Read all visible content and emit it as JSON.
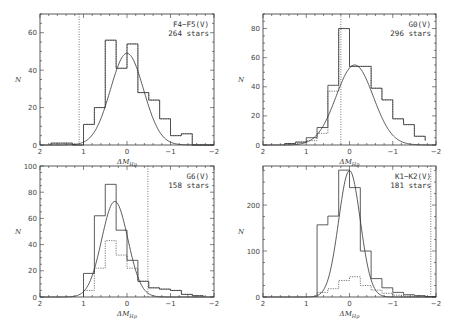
{
  "figure": {
    "xlabel": "ΔM_Hp",
    "ylabel": "N"
  },
  "chart_data": [
    {
      "type": "bar",
      "subtype": "histogram_with_gaussian_fit",
      "title": "F4-F5(V)",
      "label_lines": [
        "F4−F5(V)",
        "264 stars"
      ],
      "xlabel": "ΔM_Hp",
      "ylabel": "N",
      "xlim": [
        2,
        -2
      ],
      "ylim": [
        0,
        70
      ],
      "xticks": [
        2,
        1,
        0,
        -1,
        -2
      ],
      "yticks": [
        0,
        20,
        40,
        60
      ],
      "bin_edges": [
        1.75,
        1.5,
        1.25,
        1.0,
        0.75,
        0.5,
        0.25,
        0.0,
        -0.25,
        -0.5,
        -0.75,
        -1.0,
        -1.25,
        -1.5,
        -1.75,
        -2.0
      ],
      "series": [
        {
          "name": "solid histogram",
          "style": "solid",
          "values": [
            1,
            1,
            0,
            11,
            20,
            56,
            41,
            54,
            28,
            24,
            14,
            5,
            6,
            0,
            0
          ]
        },
        {
          "name": "dotted histogram",
          "style": "dotted",
          "values": [
            1,
            1,
            0,
            11,
            20,
            56,
            41,
            54,
            28,
            24,
            14,
            5,
            6,
            0,
            0
          ]
        },
        {
          "name": "gaussian fit",
          "style": "curve",
          "mean": 0.0,
          "sigma": 0.38,
          "amplitude": 49
        }
      ],
      "vline": {
        "x": 1.1,
        "style": "dotted"
      },
      "grid": false
    },
    {
      "type": "bar",
      "subtype": "histogram_with_gaussian_fit",
      "title": "G0(V)",
      "label_lines": [
        "G0(V)",
        "296 stars"
      ],
      "xlabel": "ΔM_Hp",
      "ylabel": "N",
      "xlim": [
        2,
        -2
      ],
      "ylim": [
        0,
        90
      ],
      "xticks": [
        2,
        1,
        0,
        -1,
        -2
      ],
      "yticks": [
        0,
        20,
        40,
        60,
        80
      ],
      "bin_edges": [
        1.5,
        1.25,
        1.0,
        0.75,
        0.5,
        0.25,
        0.0,
        -0.25,
        -0.5,
        -0.75,
        -1.0,
        -1.25,
        -1.5,
        -1.75
      ],
      "series": [
        {
          "name": "solid histogram",
          "style": "solid",
          "values": [
            1,
            2,
            5,
            12,
            41,
            80,
            54,
            54,
            39,
            31,
            18,
            14,
            6,
            3
          ]
        },
        {
          "name": "dotted histogram",
          "style": "dotted",
          "values": [
            1,
            2,
            3,
            8,
            37,
            80,
            54,
            54,
            39,
            31,
            18,
            14,
            6,
            3
          ]
        },
        {
          "name": "gaussian fit",
          "style": "curve",
          "mean": -0.12,
          "sigma": 0.43,
          "amplitude": 55
        }
      ],
      "vline": {
        "x": 0.2,
        "style": "dotted"
      },
      "grid": false
    },
    {
      "type": "bar",
      "subtype": "histogram_with_gaussian_fit",
      "title": "G6(V)",
      "label_lines": [
        "G6(V)",
        "158 stars"
      ],
      "xlabel": "ΔM_Hp",
      "ylabel": "N",
      "xlim": [
        2,
        -2
      ],
      "ylim": [
        0,
        100
      ],
      "xticks": [
        2,
        1,
        0,
        -1,
        -2
      ],
      "yticks": [
        0,
        20,
        40,
        60,
        80,
        100
      ],
      "bin_edges": [
        1.0,
        0.75,
        0.5,
        0.25,
        0.0,
        -0.25,
        -0.5,
        -0.75,
        -1.0,
        -1.25,
        -1.5,
        -1.75
      ],
      "series": [
        {
          "name": "solid histogram",
          "style": "solid",
          "values": [
            18,
            62,
            86,
            51,
            28,
            12,
            7,
            6,
            5,
            2,
            1
          ]
        },
        {
          "name": "dotted histogram",
          "style": "dotted",
          "values": [
            5,
            22,
            43,
            32,
            22,
            12,
            7,
            6,
            5,
            2,
            1
          ]
        },
        {
          "name": "gaussian fit",
          "style": "curve",
          "mean": 0.28,
          "sigma": 0.3,
          "amplitude": 73
        }
      ],
      "vline": {
        "x": -0.48,
        "style": "dotted"
      },
      "grid": false
    },
    {
      "type": "bar",
      "subtype": "histogram_with_gaussian_fit",
      "title": "K1-K2(V)",
      "label_lines": [
        "K1−K2(V)",
        "181 stars"
      ],
      "xlabel": "ΔM_Hp",
      "ylabel": "N",
      "xlim": [
        2,
        -2
      ],
      "ylim": [
        0,
        285
      ],
      "xticks": [
        2,
        1,
        0,
        -1,
        -2
      ],
      "yticks": [
        0,
        100,
        200
      ],
      "bin_edges": [
        0.75,
        0.5,
        0.25,
        0.0,
        -0.25,
        -0.5,
        -0.75,
        -1.0,
        -1.25,
        -1.5,
        -1.75,
        -2.0
      ],
      "series": [
        {
          "name": "solid histogram",
          "style": "solid",
          "values": [
            157,
            176,
            276,
            238,
            100,
            40,
            20,
            10,
            5,
            3,
            1
          ]
        },
        {
          "name": "dotted histogram",
          "style": "dotted",
          "values": [
            10,
            18,
            36,
            44,
            25,
            15,
            8,
            4,
            2,
            1,
            0
          ]
        },
        {
          "name": "gaussian fit",
          "style": "curve",
          "mean": 0.0,
          "sigma": 0.25,
          "amplitude": 275
        }
      ],
      "vline": {
        "x": -1.88,
        "style": "dotted"
      },
      "grid": false
    }
  ],
  "layout": {
    "panels": [
      {
        "x0": 40,
        "x1": 214,
        "y0": 14,
        "y1": 145
      },
      {
        "x0": 263,
        "x1": 436,
        "y0": 14,
        "y1": 145
      },
      {
        "x0": 40,
        "x1": 214,
        "y0": 166,
        "y1": 297
      },
      {
        "x0": 263,
        "x1": 436,
        "y0": 166,
        "y1": 297
      }
    ],
    "colors": {
      "line": "#333333",
      "dotted": "#555555",
      "background": "#ffffff"
    }
  }
}
